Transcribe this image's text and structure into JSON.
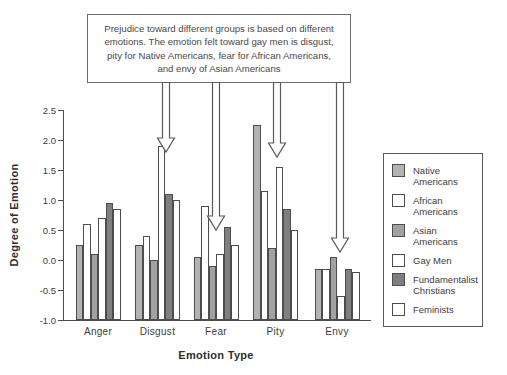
{
  "figure": {
    "annotation_box": {
      "text": "Prejudice toward different groups is based on different emotions. The emotion felt toward gay men is disgust, pity for Native Americans, fear for African Americans, and envy of Asian Americans"
    },
    "x_axis": {
      "title": "Emotion Type"
    },
    "y_axis": {
      "title": "Degree of Emotion",
      "tick_labels": [
        "2.5",
        "2.0",
        "1.5",
        "1.0",
        "0.5",
        "0.0",
        "-0.5",
        "-1.0"
      ]
    },
    "legend": {
      "items": [
        {
          "label": "Native Americans",
          "color": "#b3b3b3"
        },
        {
          "label": "African Americans",
          "color": "#ffffff"
        },
        {
          "label": "Asian Americans",
          "color": "#a1a1a1"
        },
        {
          "label": "Gay Men",
          "color": "#ffffff"
        },
        {
          "label": "Fundamentalist Christians",
          "color": "#7f7f7f"
        },
        {
          "label": "Feminists",
          "color": "#ffffff"
        }
      ]
    }
  },
  "chart_data": {
    "type": "bar",
    "title": "",
    "categories": [
      "Anger",
      "Disgust",
      "Fear",
      "Pity",
      "Envy"
    ],
    "series": [
      {
        "name": "Native Americans",
        "color": "#b3b3b3",
        "values": [
          0.25,
          0.25,
          0.05,
          2.25,
          -0.15
        ]
      },
      {
        "name": "African Americans",
        "color": "#ffffff",
        "values": [
          0.6,
          0.4,
          0.9,
          1.15,
          -0.15
        ]
      },
      {
        "name": "Asian Americans",
        "color": "#a1a1a1",
        "values": [
          0.1,
          0.0,
          -0.1,
          0.2,
          0.05
        ]
      },
      {
        "name": "Gay Men",
        "color": "#ffffff",
        "values": [
          0.7,
          1.9,
          0.1,
          1.55,
          -0.6
        ]
      },
      {
        "name": "Fundamentalist Christians",
        "color": "#7f7f7f",
        "values": [
          0.95,
          1.1,
          0.55,
          0.85,
          -0.15
        ]
      },
      {
        "name": "Feminists",
        "color": "#ffffff",
        "values": [
          0.85,
          1.0,
          0.25,
          0.5,
          -0.2
        ]
      }
    ],
    "xlabel": "Emotion Type",
    "ylabel": "Degree of Emotion",
    "ylim": [
      -1.0,
      2.5
    ],
    "ytick_step": 0.5,
    "bar_baseline": -1.0,
    "grid": false,
    "legend_position": "right",
    "annotations": {
      "box_text": "Prejudice toward different groups is based on different emotions. The emotion felt toward gay men is disgust, pity for Native Americans, fear for African Americans, and envy of Asian Americans",
      "arrow_targets": [
        "Disgust",
        "Fear",
        "Pity",
        "Envy"
      ]
    }
  }
}
